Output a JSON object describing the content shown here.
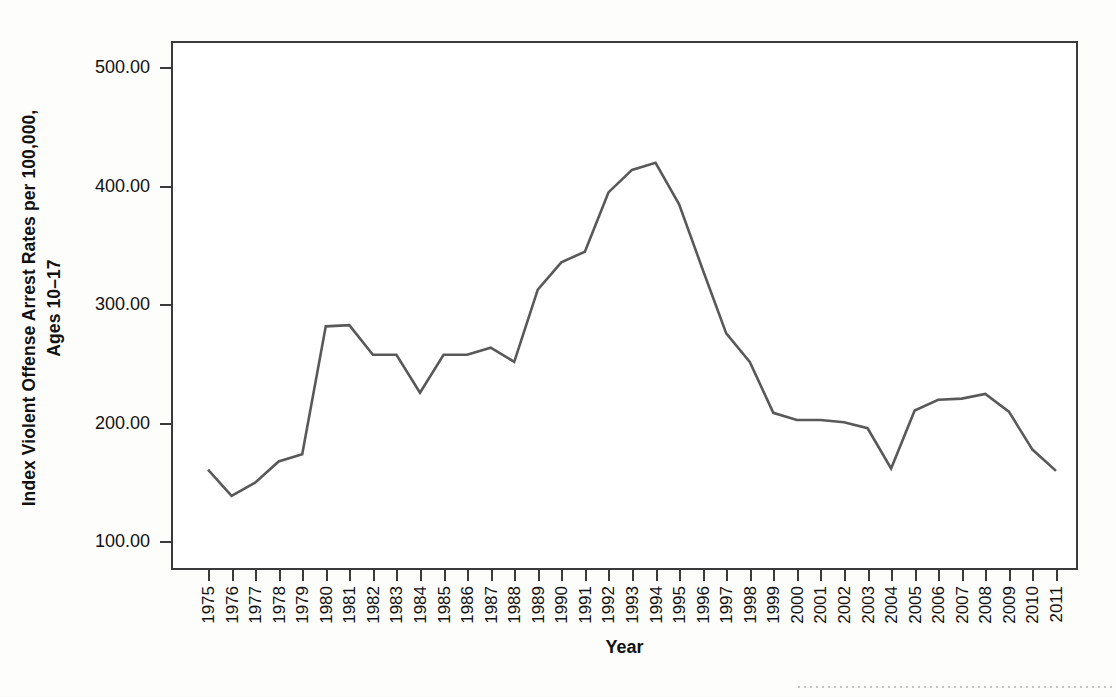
{
  "chart_data": {
    "type": "line",
    "title": "",
    "xlabel": "Year",
    "ylabel_line1": "Index Violent Offense Arrest Rates per 100,000,",
    "ylabel_line2": "Ages 10–17",
    "ylim": [
      80,
      520
    ],
    "y_ticks": [
      "100.00",
      "200.00",
      "300.00",
      "400.00",
      "500.00"
    ],
    "y_tick_values": [
      100,
      200,
      300,
      400,
      500
    ],
    "grid": false,
    "legend": "none",
    "line_color": "#595959",
    "categories": [
      "1975",
      "1976",
      "1977",
      "1978",
      "1979",
      "1980",
      "1981",
      "1982",
      "1983",
      "1984",
      "1985",
      "1986",
      "1987",
      "1988",
      "1989",
      "1990",
      "1991",
      "1992",
      "1993",
      "1994",
      "1995",
      "1996",
      "1997",
      "1998",
      "1999",
      "2000",
      "2001",
      "2002",
      "2003",
      "2004",
      "2005",
      "2006",
      "2007",
      "2008",
      "2009",
      "2010",
      "2011"
    ],
    "values": [
      161,
      139,
      150,
      168,
      174,
      282,
      283,
      258,
      258,
      226,
      258,
      258,
      264,
      252,
      313,
      336,
      345,
      395,
      414,
      420,
      385,
      330,
      276,
      252,
      209,
      203,
      203,
      201,
      196,
      162,
      211,
      220,
      221,
      225,
      210,
      178,
      160
    ],
    "series": [
      {
        "name": "Index Violent Offense Arrest Rate",
        "values": [
          161,
          139,
          150,
          168,
          174,
          282,
          283,
          258,
          258,
          226,
          258,
          258,
          264,
          252,
          313,
          336,
          345,
          395,
          414,
          420,
          385,
          330,
          276,
          252,
          209,
          203,
          203,
          201,
          196,
          162,
          211,
          220,
          221,
          225,
          210,
          178,
          160
        ]
      }
    ]
  },
  "axis": {
    "x_title": "Year"
  }
}
